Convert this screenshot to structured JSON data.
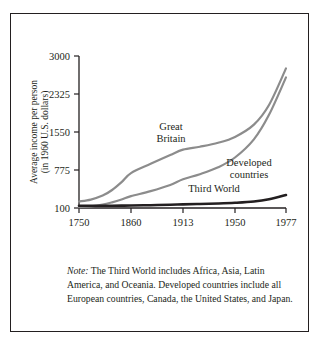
{
  "figure": {
    "note_prefix": "Note:",
    "note_text": " The Third World includes Africa, Asia, Latin America, and Oceania. Developed countries include all European countries, Canada, the United States, and Japan."
  },
  "chart_data": {
    "type": "line",
    "title": "",
    "xlabel": "",
    "ylabel": "Average income per person",
    "ylabel_line2": "(in 1960 U.S. dollars)",
    "xlim": [
      1750,
      1977
    ],
    "ylim": [
      100,
      3000
    ],
    "grid": false,
    "legend_position": "inline-annotations",
    "xticks": [
      1750,
      1860,
      1913,
      1950,
      1977
    ],
    "xtick_labels": [
      "1750",
      "1860",
      "1913",
      "1950",
      "1977"
    ],
    "yticks": [
      100,
      775,
      1550,
      2325,
      3000
    ],
    "ytick_labels": [
      "100",
      "775",
      "1550",
      "2325",
      "3000"
    ],
    "colors": {
      "great_britain": "#8c8c8c",
      "developed_countries": "#8c8c8c",
      "third_world": "#231f20",
      "axis": "#231f20",
      "frame": "#231f20"
    },
    "series": [
      {
        "name": "Great Britain",
        "label": "Great Britain",
        "label_line1": "Great",
        "label_line2": "Britain",
        "color": "#8c8c8c",
        "x": [
          1750,
          1775,
          1800,
          1820,
          1840,
          1860,
          1880,
          1900,
          1913,
          1925,
          1938,
          1950,
          1960,
          1968,
          1977
        ],
        "values": [
          215,
          250,
          320,
          420,
          560,
          720,
          900,
          1080,
          1190,
          1250,
          1330,
          1450,
          1700,
          2100,
          2780
        ]
      },
      {
        "name": "Developed countries",
        "label": "Developed countries",
        "label_line1": "Developed",
        "label_line2": "countries",
        "color": "#8c8c8c",
        "x": [
          1750,
          1775,
          1800,
          1820,
          1840,
          1860,
          1880,
          1900,
          1913,
          1925,
          1938,
          1950,
          1960,
          1968,
          1977
        ],
        "values": [
          115,
          130,
          160,
          200,
          250,
          310,
          400,
          510,
          610,
          700,
          830,
          1030,
          1400,
          1900,
          2620
        ]
      },
      {
        "name": "Third World",
        "label": "Third World",
        "label_line1": "Third World",
        "label_line2": "",
        "color": "#231f20",
        "x": [
          1750,
          1775,
          1800,
          1820,
          1840,
          1860,
          1880,
          1900,
          1913,
          1925,
          1938,
          1950,
          1960,
          1968,
          1977
        ],
        "values": [
          140,
          140,
          140,
          140,
          142,
          145,
          150,
          158,
          165,
          172,
          180,
          192,
          215,
          255,
          330
        ]
      }
    ]
  }
}
